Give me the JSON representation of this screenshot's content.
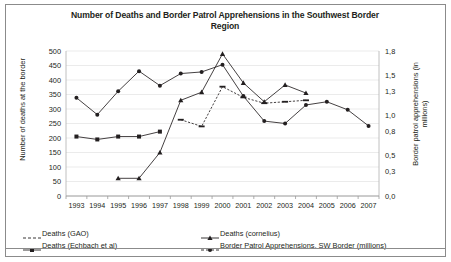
{
  "figure": {
    "title": "Number of Deaths and Border Patrol Apprehensions in the Southwest Border Region",
    "frame_color": "#8b8b8b",
    "background": "#ffffff"
  },
  "axes": {
    "left": {
      "label": "Number of deaths at the border",
      "ticks": [
        "0",
        "50",
        "100",
        "150",
        "200",
        "250",
        "300",
        "350",
        "400",
        "450",
        "500"
      ],
      "min": 0,
      "max": 500
    },
    "right": {
      "label": "Border patrol apprehensions (in millions)",
      "ticks": [
        "0,0",
        "0,3",
        "0,5",
        "0,8",
        "1,0",
        "1,3",
        "1,5",
        "1,8"
      ],
      "min": 0,
      "max": 1.8
    },
    "x": {
      "label": "",
      "ticks": [
        "1993",
        "1994",
        "1995",
        "1996",
        "1997",
        "1998",
        "1999",
        "2000",
        "2001",
        "2002",
        "2003",
        "2004",
        "2005",
        "2006",
        "2007"
      ]
    }
  },
  "legend": {
    "position": "bottom",
    "items": [
      {
        "label": "Deaths (GAO)",
        "marker": "dash",
        "column": 1
      },
      {
        "label": "Deaths (Echbach et al)",
        "marker": "square",
        "column": 1
      },
      {
        "label": "Deaths (cornelius)",
        "marker": "triangle",
        "column": 2
      },
      {
        "label": "Border Patrol Apprehensions, SW Border (millions)",
        "marker": "circle",
        "column": 2
      }
    ]
  },
  "chart_data": {
    "type": "line",
    "title": "Number of Deaths and Border Patrol Apprehensions in the Southwest Border Region",
    "xlabel": "",
    "ylabel": "Number of deaths at the border",
    "y2label": "Border patrol apprehensions (in millions)",
    "categories": [
      "1993",
      "1994",
      "1995",
      "1996",
      "1997",
      "1998",
      "1999",
      "2000",
      "2001",
      "2002",
      "2003",
      "2004",
      "2005",
      "2006",
      "2007"
    ],
    "ylim": [
      0,
      500
    ],
    "y2lim": [
      0,
      1.8
    ],
    "grid": true,
    "series": [
      {
        "name": "Deaths (GAO)",
        "axis": "left",
        "marker": "dash",
        "color": "#231f20",
        "values": [
          null,
          null,
          null,
          null,
          null,
          263,
          240,
          377,
          340,
          320,
          325,
          330,
          null,
          null,
          null
        ]
      },
      {
        "name": "Deaths (Echbach et al)",
        "axis": "left",
        "marker": "square",
        "color": "#231f20",
        "values": [
          205,
          195,
          205,
          205,
          222,
          null,
          null,
          null,
          null,
          null,
          null,
          null,
          null,
          null,
          null
        ]
      },
      {
        "name": "Deaths (cornelius)",
        "axis": "left",
        "marker": "triangle",
        "color": "#231f20",
        "values": [
          null,
          null,
          61,
          61,
          150,
          330,
          358,
          490,
          390,
          325,
          383,
          355,
          null,
          null,
          null
        ]
      },
      {
        "name": "Border Patrol Apprehensions, SW Border (millions)",
        "axis": "right",
        "marker": "circle",
        "color": "#231f20",
        "values": [
          1.22,
          1.01,
          1.3,
          1.55,
          1.37,
          1.52,
          1.54,
          1.63,
          1.24,
          0.93,
          0.9,
          1.13,
          1.17,
          1.07,
          0.87
        ]
      }
    ]
  }
}
